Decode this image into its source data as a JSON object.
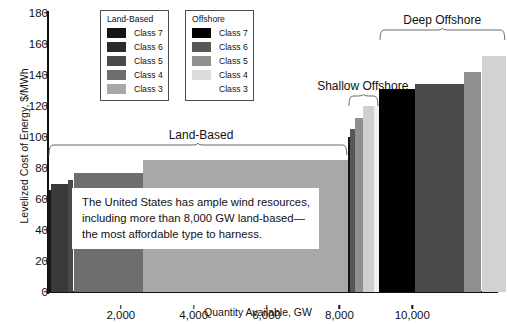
{
  "chart_data": {
    "type": "bar",
    "title": "",
    "subtitle": "",
    "xlabel": "Quantity Available, GW",
    "ylabel": "Levelized Cost of Energy, $/MWh",
    "xlim": [
      0,
      12600
    ],
    "ylim": [
      0,
      180
    ],
    "ytick_values": [
      0,
      20,
      40,
      60,
      80,
      100,
      120,
      140,
      160,
      180
    ],
    "ytick_labels": [
      "0",
      "20",
      "40",
      "60",
      "80",
      "100",
      "120",
      "140",
      "160",
      "180"
    ],
    "xtick_values": [
      2000,
      4000,
      6000,
      8000,
      10000
    ],
    "xtick_labels": [
      "2,000",
      "4,000",
      "6,000",
      "8,000",
      "10,000"
    ],
    "grid": false,
    "legend_position": "upper-left-inside",
    "note": "Supply curve: bar widths are quantity available (GW), bar heights are levelized cost of energy ($/MWh).",
    "bars": [
      {
        "group": "Land-Based",
        "resource_class": "Class 7",
        "x_start": 0,
        "x_end": 90,
        "lcoe": 66,
        "color": "#151515"
      },
      {
        "group": "Land-Based",
        "resource_class": "Class 6",
        "x_start": 90,
        "x_end": 560,
        "lcoe": 70,
        "color": "#3a3a3a"
      },
      {
        "group": "Land-Based",
        "resource_class": "Class 5",
        "x_start": 560,
        "x_end": 700,
        "lcoe": 72,
        "color": "#4a4a4a"
      },
      {
        "group": "Land-Based",
        "resource_class": "Class 4",
        "x_start": 700,
        "x_end": 2600,
        "lcoe": 77,
        "color": "#6e6e6e"
      },
      {
        "group": "Land-Based",
        "resource_class": "Class 3",
        "x_start": 2600,
        "x_end": 8230,
        "lcoe": 85,
        "color": "#a8a8a8"
      },
      {
        "group": "Shallow Offshore",
        "resource_class": "Class 7",
        "x_start": 8230,
        "x_end": 8300,
        "lcoe": 100,
        "color": "#151515"
      },
      {
        "group": "Shallow Offshore",
        "resource_class": "Class 6",
        "x_start": 8300,
        "x_end": 8420,
        "lcoe": 105,
        "color": "#575757"
      },
      {
        "group": "Shallow Offshore",
        "resource_class": "Class 5",
        "x_start": 8420,
        "x_end": 8660,
        "lcoe": 112,
        "color": "#8f8f8f"
      },
      {
        "group": "Shallow Offshore",
        "resource_class": "Class 4",
        "x_start": 8660,
        "x_end": 8960,
        "lcoe": 120,
        "color": "#cfcfcf"
      },
      {
        "group": "Shallow Offshore",
        "resource_class": "Class 3",
        "x_start": 8960,
        "x_end": 9080,
        "lcoe": 120,
        "color": "#f2f2f2"
      },
      {
        "group": "Deep Offshore",
        "resource_class": "Class 7",
        "x_start": 9080,
        "x_end": 10070,
        "lcoe": 131,
        "color": "#000000"
      },
      {
        "group": "Deep Offshore",
        "resource_class": "Class 6",
        "x_start": 10070,
        "x_end": 11420,
        "lcoe": 134,
        "color": "#4a4a4a"
      },
      {
        "group": "Deep Offshore",
        "resource_class": "Class 5",
        "x_start": 11420,
        "x_end": 11900,
        "lcoe": 142,
        "color": "#8f8f8f"
      },
      {
        "group": "Deep Offshore",
        "resource_class": "Class 4",
        "x_start": 11900,
        "x_end": 12560,
        "lcoe": 152,
        "color": "#d2d2d2"
      }
    ],
    "group_annotations": [
      {
        "label": "Land-Based",
        "x_center": 4200,
        "bracket_x_start": 0,
        "bracket_x_end": 8230,
        "label_y": 98
      },
      {
        "label": "Shallow Offshore",
        "x_center": 8640,
        "bracket_x_start": 8230,
        "bracket_x_end": 9080,
        "label_y": 130
      },
      {
        "label": "Deep Offshore",
        "x_center": 10820,
        "bracket_x_start": 9080,
        "bracket_x_end": 12560,
        "label_y": 172
      }
    ],
    "annotations": [
      {
        "kind": "callout-textbox",
        "lines": [
          "The United States has ample wind resources,",
          "including more than 8,000 GW land-based—",
          "the most affordable type to harness."
        ]
      }
    ]
  },
  "axes": {
    "ylabel": "Levelized Cost of Energy, $/MWh",
    "xlabel": "Quantity Available, GW",
    "ytick_labels": [
      "180",
      "160",
      "140",
      "120",
      "100",
      "80",
      "60",
      "40",
      "20",
      "0"
    ],
    "xtick_labels": [
      "2,000",
      "4,000",
      "6,000",
      "8,000",
      "10,000"
    ]
  },
  "legends": [
    {
      "title": "Land-Based",
      "entries": [
        {
          "label": "Class 7",
          "color": "#151515",
          "swatch": true
        },
        {
          "label": "Class 6",
          "color": "#2b2b2b",
          "swatch": true
        },
        {
          "label": "Class 5",
          "color": "#4a4a4a",
          "swatch": true
        },
        {
          "label": "Class 4",
          "color": "#6e6e6e",
          "swatch": true
        },
        {
          "label": "Class 3",
          "color": "#a8a8a8",
          "swatch": true
        }
      ]
    },
    {
      "title": "Offshore",
      "entries": [
        {
          "label": "Class 7",
          "color": "#000000",
          "swatch": true
        },
        {
          "label": "Class 6",
          "color": "#575757",
          "swatch": true
        },
        {
          "label": "Class 5",
          "color": "#8f8f8f",
          "swatch": true
        },
        {
          "label": "Class 4",
          "color": "#dcdcdc",
          "swatch": true
        },
        {
          "label": "Class 3",
          "color": "#ffffff",
          "swatch": false
        }
      ]
    }
  ],
  "group_labels": {
    "land_based": "Land-Based",
    "shallow_offshore": "Shallow Offshore",
    "deep_offshore": "Deep Offshore"
  },
  "callout": {
    "line1": "The United States has ample wind resources,",
    "line2": "including more than 8,000 GW land-based—",
    "line3": "the most affordable type to harness."
  },
  "colors": {
    "axis": "#111111",
    "text": "#111111",
    "background": "#ffffff",
    "legend_border": "#4d4d4d"
  }
}
